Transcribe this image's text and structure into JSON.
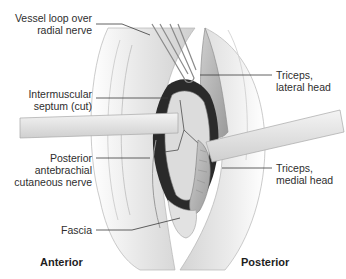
{
  "figure": {
    "type": "surgical-anatomy-illustration",
    "labels_left": [
      {
        "id": "vessel-loop",
        "lines": [
          "Vessel loop over",
          "radial nerve"
        ]
      },
      {
        "id": "intermuscular-septum",
        "lines": [
          "Intermuscular",
          "septum (cut)"
        ]
      },
      {
        "id": "posterior-antebrachial-nerve",
        "lines": [
          "Posterior",
          "antebrachial",
          "cutaneous nerve"
        ]
      },
      {
        "id": "fascia",
        "lines": [
          "Fascia"
        ]
      }
    ],
    "labels_right": [
      {
        "id": "triceps-lateral",
        "lines": [
          "Triceps,",
          "lateral head"
        ]
      },
      {
        "id": "triceps-medial",
        "lines": [
          "Triceps,",
          "medial head"
        ]
      }
    ],
    "orientation": {
      "left": "Anterior",
      "right": "Posterior"
    },
    "colors": {
      "label_text": "#2e2e2e",
      "leader_line": "#3a3a3a",
      "skin": "#e9e9e9",
      "muscle": "#bdbdbd",
      "cavity": "#2a2a2a"
    }
  }
}
